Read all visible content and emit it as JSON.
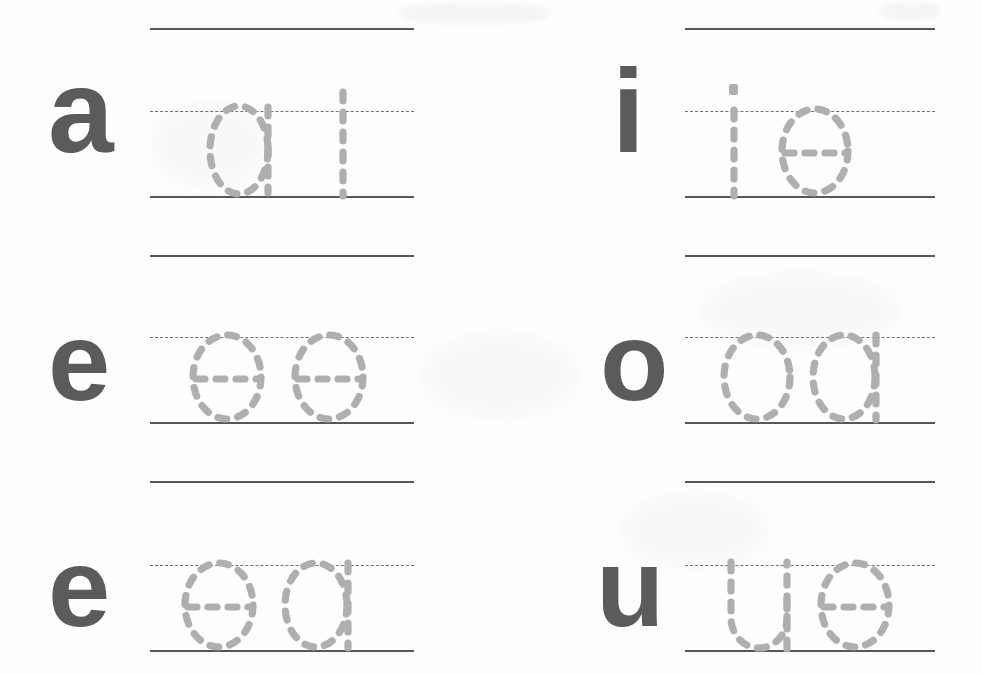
{
  "worksheet": {
    "title": "Lowercase vowel tracing practice worksheet",
    "line_color": "#555759",
    "midline_color": "#6f7174",
    "label_color": "#5b5b5b",
    "trace_color": "#adafb1",
    "columns": 2,
    "rows": 3,
    "cells": [
      {
        "id": "cell-row1-left",
        "label": "a",
        "traced_text": "at",
        "traced_letters": [
          "a",
          "t"
        ]
      },
      {
        "id": "cell-row1-right",
        "label": "i",
        "traced_text": "ie",
        "traced_letters": [
          "i",
          "e"
        ]
      },
      {
        "id": "cell-row2-left",
        "label": "e",
        "traced_text": "ee",
        "traced_letters": [
          "e",
          "e"
        ]
      },
      {
        "id": "cell-row2-right",
        "label": "o",
        "traced_text": "oa",
        "traced_letters": [
          "o",
          "a"
        ]
      },
      {
        "id": "cell-row3-left",
        "label": "e",
        "traced_text": "ea",
        "traced_letters": [
          "e",
          "a"
        ]
      },
      {
        "id": "cell-row3-right",
        "label": "u",
        "traced_text": "ue",
        "traced_letters": [
          "u",
          "e"
        ]
      }
    ]
  }
}
